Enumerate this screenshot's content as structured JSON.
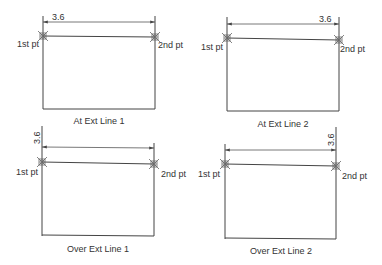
{
  "panels": [
    {
      "id": "at-ext-line-1",
      "caption": "At Ext Line 1",
      "dimension_text": "3.6",
      "first_point_label": "1st pt",
      "second_point_label": "2nd pt"
    },
    {
      "id": "at-ext-line-2",
      "caption": "At Ext Line 2",
      "dimension_text": "3.6",
      "first_point_label": "1st pt",
      "second_point_label": "2nd pt"
    },
    {
      "id": "over-ext-line-1",
      "caption": "Over Ext Line 1",
      "dimension_text": "3.6",
      "first_point_label": "1st pt",
      "second_point_label": "2nd pt"
    },
    {
      "id": "over-ext-line-2",
      "caption": "Over Ext Line 2",
      "dimension_text": "3.6",
      "first_point_label": "1st pt",
      "second_point_label": "2nd pt"
    }
  ],
  "colors": {
    "line": "#444444",
    "text": "#333333",
    "background": "#ffffff"
  }
}
